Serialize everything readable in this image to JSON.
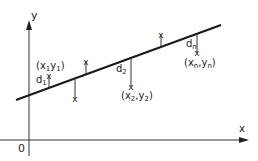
{
  "diagram": {
    "type": "linear-regression-residuals",
    "axes": {
      "x_label": "x",
      "y_label": "y",
      "origin_label": "0"
    },
    "regression_line": {
      "from": [
        16,
        100
      ],
      "to": [
        221,
        25
      ]
    },
    "points": [
      {
        "x": 49,
        "y": 77,
        "side": "above",
        "residual_label": "d1",
        "point_label": "(x1y1)"
      },
      {
        "x": 75,
        "y": 98,
        "side": "below"
      },
      {
        "x": 86,
        "y": 62,
        "side": "above"
      },
      {
        "x": 131,
        "y": 87,
        "side": "below",
        "residual_label": "d2",
        "point_label": "(x2,y2)"
      },
      {
        "x": 161,
        "y": 35,
        "side": "above"
      },
      {
        "x": 197,
        "y": 52,
        "side": "below",
        "residual_label": "dn",
        "point_label": "(xn,yn)"
      }
    ],
    "labels": {
      "d1": {
        "base": "d",
        "sub": "1"
      },
      "p1": {
        "open": "(x",
        "s1": "1",
        "mid": "y",
        "s2": "1",
        "close": ")"
      },
      "d2": {
        "base": "d",
        "sub": "2"
      },
      "p2": {
        "open": "(x",
        "s1": "2",
        "mid": ",y",
        "s2": "2",
        "close": ")"
      },
      "dn": {
        "base": "d",
        "sub": "n"
      },
      "pn": {
        "open": "(x",
        "s1": "n",
        "mid": ",y",
        "s2": "n",
        "close": ")"
      }
    },
    "marker": "x",
    "line_color": "#1a1a1a"
  }
}
